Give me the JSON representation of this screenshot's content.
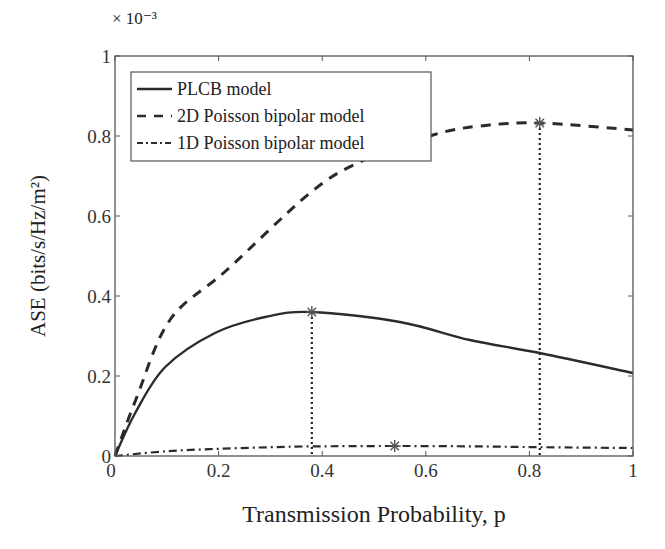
{
  "chart_data": {
    "type": "line",
    "title": "",
    "xlabel": "Transmission Probability, p",
    "ylabel": "ASE (bits/s/Hz/m²)",
    "y_multiplier": "× 10⁻³",
    "xlim": [
      0,
      1
    ],
    "ylim": [
      0,
      1
    ],
    "xticks": [
      0,
      0.2,
      0.4,
      0.6,
      0.8,
      1
    ],
    "xtick_labels": [
      "0",
      "0.2",
      "0.4",
      "0.6",
      "0.8",
      "1"
    ],
    "yticks": [
      0,
      0.2,
      0.4,
      0.6,
      0.8,
      1
    ],
    "ytick_labels": [
      "0",
      "0.2",
      "0.4",
      "0.6",
      "0.8",
      "1"
    ],
    "grid": false,
    "legend_position": "upper left",
    "series": [
      {
        "name": "PLCB model",
        "style": "solid",
        "x": [
          0,
          0.039,
          0.097,
          0.193,
          0.29,
          0.38,
          0.55,
          0.685,
          0.82,
          1.0
        ],
        "y": [
          0,
          0.1075,
          0.2225,
          0.3075,
          0.3475,
          0.36,
          0.335,
          0.29,
          0.2575,
          0.2075
        ],
        "optimum": {
          "x": 0.38,
          "y": 0.36
        }
      },
      {
        "name": "2D Poisson bipolar model",
        "style": "dashed",
        "x": [
          0,
          0.04,
          0.106,
          0.216,
          0.376,
          0.473,
          0.614,
          0.705,
          0.82,
          1.0
        ],
        "y": [
          0,
          0.14,
          0.34,
          0.465,
          0.657,
          0.735,
          0.8025,
          0.825,
          0.8325,
          0.815
        ],
        "optimum": {
          "x": 0.82,
          "y": 0.8325
        }
      },
      {
        "name": "1D Poisson bipolar model",
        "style": "dash-dot",
        "x": [
          0,
          0.1,
          0.2,
          0.3,
          0.38,
          0.54,
          0.7,
          0.82,
          1.0
        ],
        "y": [
          0,
          0.012,
          0.018,
          0.022,
          0.024,
          0.025,
          0.024,
          0.022,
          0.02
        ],
        "optimum": {
          "x": 0.54,
          "y": 0.025
        }
      }
    ],
    "annotations": [
      {
        "type": "vertical-dotted-line",
        "x": 0.38,
        "from": 0,
        "to": 0.36
      },
      {
        "type": "vertical-dotted-line",
        "x": 0.82,
        "from": 0,
        "to": 0.8325
      },
      {
        "type": "star-marker",
        "x": 0.38,
        "y": 0.36
      },
      {
        "type": "star-marker",
        "x": 0.82,
        "y": 0.8325
      },
      {
        "type": "star-marker",
        "x": 0.54,
        "y": 0.025
      }
    ]
  },
  "colors": {
    "line": "#2b2b2b",
    "axis": "#555555",
    "marker": "#555555",
    "background": "#ffffff"
  }
}
